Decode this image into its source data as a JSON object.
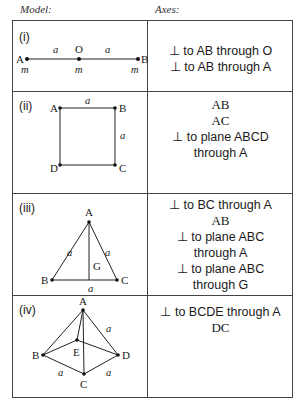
{
  "headers": {
    "model": "Model:",
    "axes": "Axes:"
  },
  "rows": [
    {
      "label": "(i)",
      "figure": {
        "shape": "line-segment",
        "points": [
          "A",
          "O",
          "B"
        ],
        "masses": [
          "m",
          "m",
          "m"
        ],
        "lengths": [
          "a",
          "a"
        ]
      },
      "axes": [
        {
          "prefix": "⊥",
          "text": " to AB through O"
        },
        {
          "prefix": "⊥",
          "text": " to AB through A"
        }
      ]
    },
    {
      "label": "(ii)",
      "figure": {
        "shape": "square",
        "points": [
          "A",
          "B",
          "C",
          "D"
        ],
        "lengths": [
          "a",
          "a"
        ]
      },
      "axes": [
        {
          "prefix": "",
          "text": "AB"
        },
        {
          "prefix": "",
          "text": "AC"
        },
        {
          "prefix": "⊥",
          "text": " to plane ABCD"
        },
        {
          "prefix": "",
          "text": "through A"
        }
      ]
    },
    {
      "label": "(iii)",
      "figure": {
        "shape": "equilateral-triangle",
        "points": [
          "A",
          "B",
          "C",
          "G"
        ],
        "lengths": [
          "a",
          "a",
          "a"
        ]
      },
      "axes": [
        {
          "prefix": "⊥",
          "text": " to BC through A"
        },
        {
          "prefix": "",
          "text": "AB"
        },
        {
          "prefix": "⊥",
          "text": " to plane ABC"
        },
        {
          "prefix": "",
          "text": "through A"
        },
        {
          "prefix": "⊥",
          "text": " to plane ABC"
        },
        {
          "prefix": "",
          "text": "through G"
        }
      ]
    },
    {
      "label": "(iv)",
      "figure": {
        "shape": "square-pyramid",
        "points": [
          "A",
          "B",
          "C",
          "D",
          "E"
        ],
        "lengths": [
          "a",
          "a",
          "a"
        ]
      },
      "axes": [
        {
          "prefix": "⊥",
          "text": " to BCDE through A"
        },
        {
          "prefix": "",
          "text": "DC"
        }
      ]
    }
  ]
}
